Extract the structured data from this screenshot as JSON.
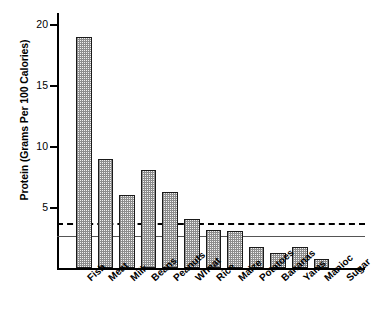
{
  "chart_data": {
    "type": "bar",
    "title": "",
    "xlabel": "",
    "ylabel": "Protein (Grams Per 100 Calories)",
    "ylim": [
      0,
      20.9
    ],
    "yticks": [
      5,
      10,
      15,
      20
    ],
    "ytick_labels": [
      "5",
      "10",
      "15",
      "20"
    ],
    "grid": false,
    "legend": "none",
    "categories": [
      "Fish",
      "Meat",
      "Milk",
      "Beans",
      "Peanuts",
      "Wheat",
      "Rice",
      "Maize",
      "Potatoes",
      "Bananas",
      "Yams",
      "Manioc",
      "Sugar"
    ],
    "values": [
      18.9,
      8.9,
      6.0,
      8.0,
      6.2,
      4.0,
      3.1,
      3.0,
      1.7,
      1.2,
      1.7,
      0.7,
      0.0
    ],
    "reference_lines": [
      {
        "name": "dashed-reference-line",
        "value": 3.7,
        "style": "dashed",
        "color": "#000000"
      },
      {
        "name": "solid-reference-line",
        "value": 2.6,
        "style": "solid",
        "color": "#555555"
      }
    ]
  },
  "axis": {
    "y_title": "Protein (Grams Per 100 Calories)",
    "y_ticks": [
      "20",
      "15",
      "10",
      "5"
    ]
  },
  "categories": {
    "c0": "Fish",
    "c1": "Meat",
    "c2": "Milk",
    "c3": "Beans",
    "c4": "Peanuts",
    "c5": "Wheat",
    "c6": "Rice",
    "c7": "Maize",
    "c8": "Potatoes",
    "c9": "Bananas",
    "c10": "Yams",
    "c11": "Manioc",
    "c12": "Sugar"
  }
}
